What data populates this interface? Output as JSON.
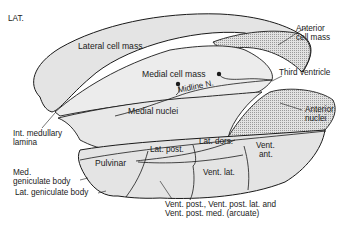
{
  "diagram": {
    "orientation_label": "LAT.",
    "regions": {
      "lateral_cell_mass": "Lateral cell mass",
      "medial_cell_mass": "Medial cell mass",
      "midline": "Midline N.",
      "medial_nuclei": "Medial nuclei",
      "pulvinar": "Pulvinar",
      "lat_post": "Lat. post.",
      "lat_dors": "Lat. dors.",
      "vent_ant_1": "Vent.",
      "vent_ant_2": "ant.",
      "vent_lat": "Vent. lat."
    },
    "callouts": {
      "anterior_cell_mass_1": "Anterior",
      "anterior_cell_mass_2": "cell mass",
      "third_ventricle": "Third ventricle",
      "anterior_nuclei_1": "Anterior",
      "anterior_nuclei_2": "nuclei",
      "int_medullary_1": "Int. medullary",
      "int_medullary_2": "lamina",
      "med_geniculate_1": "Med.",
      "med_geniculate_2": "geniculate body",
      "lat_geniculate": "Lat. geniculate body",
      "vent_post_1": "Vent. post., Vent. post. lat. and",
      "vent_post_2": "Vent. post. med. (arcuate)"
    },
    "colors": {
      "fill_light": "#e4e4e4",
      "fill_dotted": "#d2d2d2",
      "line": "#1a1a1a"
    }
  }
}
